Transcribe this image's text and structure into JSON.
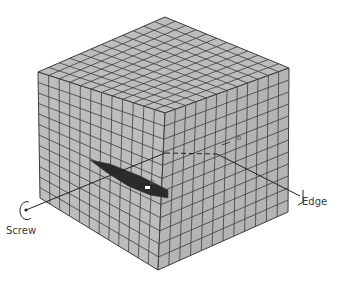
{
  "diagram": {
    "labels": {
      "edge": "Edge",
      "screw": "Screw",
      "burgers_vector_top": "b",
      "burgers_vector_bottom": "b"
    },
    "grid_cells_per_face": 12,
    "colors": {
      "face_fill": "#bdbdbd",
      "face_right_fill": "#b4b4b4",
      "grid_line": "#3c3c3c",
      "slip_plane": "#2b2b2b",
      "dislocation_line": "#222222",
      "label_text": "#3a3a3a"
    }
  }
}
